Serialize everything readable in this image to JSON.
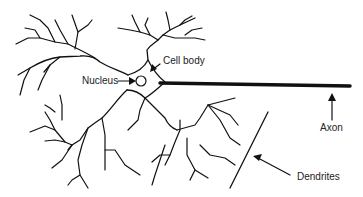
{
  "diagram": {
    "labels": {
      "nucleus": "Nucleus",
      "cell_body": "Cell body",
      "axon": "Axon",
      "dendrites": "Dendrites"
    },
    "colors": {
      "stroke": "#111111",
      "background": "#ffffff",
      "text": "#222222"
    }
  }
}
